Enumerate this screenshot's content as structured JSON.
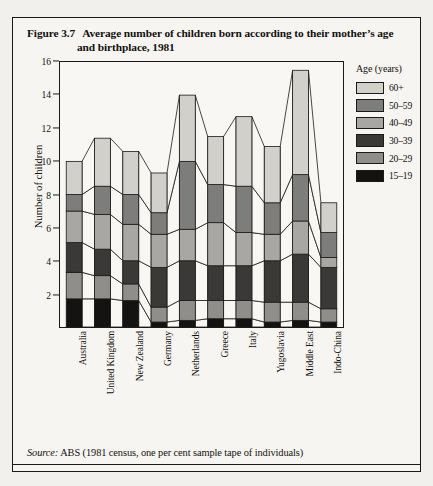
{
  "figure": {
    "number": "Figure 3.7",
    "title_line1": "Average number of children born according to their mother’s age",
    "title_line2": "and birthplace, 1981",
    "source_keyword": "Source:",
    "source_text": "ABS (1981 census, one per cent sample tape of individuals)"
  },
  "legend": {
    "title": "Age (years)",
    "items": [
      {
        "label": "60+",
        "color": "#d2d0cb"
      },
      {
        "label": "50–59",
        "color": "#7d7d7c"
      },
      {
        "label": "40–49",
        "color": "#a8a7a3"
      },
      {
        "label": "30–39",
        "color": "#3a3937"
      },
      {
        "label": "20–29",
        "color": "#8f8e8a"
      },
      {
        "label": "15–19",
        "color": "#141312"
      }
    ]
  },
  "chart_data": {
    "type": "bar",
    "stacked": true,
    "xlabel": "",
    "ylabel": "Number of children",
    "ylim": [
      0,
      16
    ],
    "yticks": [
      2,
      4,
      6,
      8,
      10,
      12,
      14,
      16
    ],
    "grid": false,
    "legend_position": "right",
    "categories": [
      "Australia",
      "United Kingdom",
      "New Zealand",
      "Germany",
      "Netherlands",
      "Greece",
      "Italy",
      "Yugoslavia",
      "Middle East",
      "Indo-China"
    ],
    "series": [
      {
        "name": "15–19",
        "color": "#141312",
        "values": [
          1.7,
          1.7,
          1.6,
          0.3,
          0.4,
          0.5,
          0.5,
          0.3,
          0.4,
          0.3
        ]
      },
      {
        "name": "20–29",
        "color": "#8f8e8a",
        "values": [
          1.6,
          1.4,
          1.0,
          0.9,
          1.2,
          1.1,
          1.1,
          1.2,
          1.1,
          0.8
        ]
      },
      {
        "name": "30–39",
        "color": "#3a3937",
        "values": [
          1.8,
          1.6,
          1.4,
          2.4,
          2.4,
          2.1,
          2.1,
          2.5,
          2.9,
          2.5
        ]
      },
      {
        "name": "40–49",
        "color": "#a8a7a3",
        "values": [
          1.9,
          2.1,
          2.2,
          2.0,
          1.9,
          2.6,
          2.0,
          1.6,
          2.0,
          0.6
        ]
      },
      {
        "name": "50–59",
        "color": "#7d7d7c",
        "values": [
          1.0,
          1.7,
          1.8,
          1.3,
          4.1,
          2.3,
          2.8,
          1.9,
          2.8,
          1.5
        ]
      },
      {
        "name": "60+",
        "color": "#d2d0cb",
        "values": [
          2.0,
          2.9,
          2.6,
          2.4,
          4.0,
          2.9,
          4.2,
          3.4,
          6.3,
          1.8
        ]
      }
    ],
    "totals": [
      10.0,
      11.4,
      10.6,
      9.3,
      14.0,
      11.5,
      12.7,
      10.9,
      15.5,
      7.5
    ]
  }
}
